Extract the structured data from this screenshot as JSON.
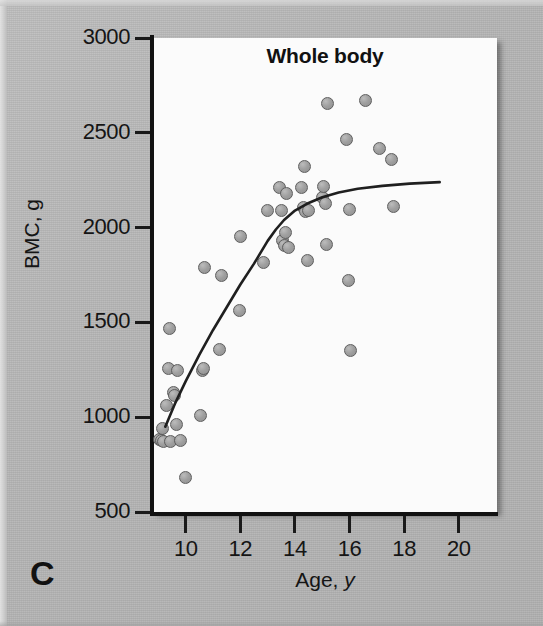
{
  "figure": {
    "panel_letter": "C",
    "background_color": "#b6b6b6",
    "plot_background_color": "#fbfbfb",
    "marker_color": "#9f9f9f",
    "marker_edge_color": "#5e5e5e",
    "line_color": "#1f1f1f"
  },
  "chart_data": {
    "type": "scatter",
    "title": "Whole body",
    "xlabel": "Age, y",
    "ylabel": "BMC, g",
    "xlim": [
      8.8,
      21.4
    ],
    "ylim": [
      500,
      3000
    ],
    "xticks": [
      10,
      12,
      14,
      16,
      18,
      20
    ],
    "yticks": [
      500,
      1000,
      1500,
      2000,
      2500,
      3000
    ],
    "xtick_labels": [
      "10",
      "12",
      "14",
      "16",
      "18",
      "20"
    ],
    "ytick_labels": [
      "500",
      "1000",
      "1500",
      "2000",
      "2500",
      "3000"
    ],
    "grid": false,
    "legend": null,
    "points": [
      [
        9.05,
        880
      ],
      [
        9.1,
        875
      ],
      [
        9.15,
        940
      ],
      [
        9.2,
        870
      ],
      [
        9.3,
        1060
      ],
      [
        9.35,
        1255
      ],
      [
        9.4,
        1470
      ],
      [
        9.45,
        870
      ],
      [
        9.55,
        1130
      ],
      [
        9.6,
        1115
      ],
      [
        9.65,
        960
      ],
      [
        9.7,
        1245
      ],
      [
        9.8,
        875
      ],
      [
        10.0,
        680
      ],
      [
        10.55,
        1010
      ],
      [
        10.6,
        1245
      ],
      [
        10.65,
        1255
      ],
      [
        10.7,
        1790
      ],
      [
        11.25,
        1355
      ],
      [
        11.3,
        1745
      ],
      [
        11.95,
        1565
      ],
      [
        12.0,
        1955
      ],
      [
        12.85,
        1815
      ],
      [
        13.0,
        2090
      ],
      [
        13.45,
        2210
      ],
      [
        13.5,
        2090
      ],
      [
        13.55,
        1930
      ],
      [
        13.6,
        1905
      ],
      [
        13.65,
        1975
      ],
      [
        13.7,
        2180
      ],
      [
        13.75,
        1895
      ],
      [
        14.25,
        2210
      ],
      [
        14.3,
        2105
      ],
      [
        14.35,
        2320
      ],
      [
        14.4,
        2085
      ],
      [
        14.45,
        1825
      ],
      [
        14.5,
        2090
      ],
      [
        15.0,
        2160
      ],
      [
        15.05,
        2215
      ],
      [
        15.1,
        2125
      ],
      [
        15.15,
        1910
      ],
      [
        15.2,
        2655
      ],
      [
        15.9,
        2465
      ],
      [
        15.95,
        1720
      ],
      [
        16.0,
        2095
      ],
      [
        16.05,
        1350
      ],
      [
        16.6,
        2670
      ],
      [
        17.1,
        2415
      ],
      [
        17.55,
        2360
      ],
      [
        17.6,
        2110
      ]
    ],
    "trend_line": {
      "label": "smoothed fit",
      "x": [
        9.25,
        9.6,
        10.0,
        10.5,
        11.0,
        11.5,
        12.0,
        12.5,
        13.0,
        13.3,
        13.6,
        14.0,
        14.5,
        15.0,
        15.6,
        16.3,
        17.2,
        18.2,
        19.3
      ],
      "y": [
        950,
        1070,
        1190,
        1330,
        1460,
        1580,
        1700,
        1810,
        1930,
        1990,
        2040,
        2090,
        2130,
        2160,
        2185,
        2205,
        2220,
        2232,
        2240
      ]
    }
  }
}
